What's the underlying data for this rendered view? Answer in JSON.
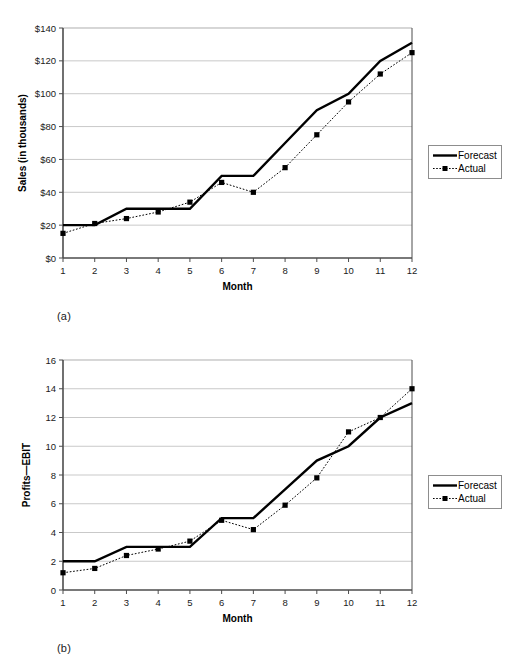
{
  "figures": [
    {
      "id": "a",
      "panel_label": "(a)",
      "legend": [
        {
          "name": "Forecast",
          "style": "solid-line"
        },
        {
          "name": "Actual",
          "style": "dotted-line-square-marker"
        }
      ]
    },
    {
      "id": "b",
      "panel_label": "(b)",
      "legend": [
        {
          "name": "Forecast",
          "style": "solid-line"
        },
        {
          "name": "Actual",
          "style": "dotted-line-square-marker"
        }
      ]
    }
  ],
  "chart_data": [
    {
      "type": "line",
      "title": "",
      "xlabel": "Month",
      "ylabel": "Sales (in thousands)",
      "x": [
        1,
        2,
        3,
        4,
        5,
        6,
        7,
        8,
        9,
        10,
        11,
        12
      ],
      "categories": [
        "1",
        "2",
        "3",
        "4",
        "5",
        "6",
        "7",
        "8",
        "9",
        "10",
        "11",
        "12"
      ],
      "ylim": [
        0,
        140
      ],
      "ytick_step": 20,
      "ytick_labels": [
        "$0",
        "$20",
        "$40",
        "$60",
        "$80",
        "$100",
        "$120",
        "$140"
      ],
      "ytick_values": [
        0,
        20,
        40,
        60,
        80,
        100,
        120,
        140
      ],
      "grid": true,
      "legend_position": "right",
      "series": [
        {
          "name": "Forecast",
          "style": "solid",
          "markers": false,
          "color": "#000000",
          "values": [
            20,
            20,
            30,
            30,
            30,
            50,
            50,
            70,
            90,
            100,
            120,
            131
          ]
        },
        {
          "name": "Actual",
          "style": "dotted",
          "markers": true,
          "color": "#000000",
          "values": [
            15,
            21,
            24,
            28,
            34,
            46,
            40,
            55,
            75,
            95,
            112,
            125
          ]
        }
      ]
    },
    {
      "type": "line",
      "title": "",
      "xlabel": "Month",
      "ylabel": "Profits—EBIT",
      "x": [
        1,
        2,
        3,
        4,
        5,
        6,
        7,
        8,
        9,
        10,
        11,
        12
      ],
      "categories": [
        "1",
        "2",
        "3",
        "4",
        "5",
        "6",
        "7",
        "8",
        "9",
        "10",
        "11",
        "12"
      ],
      "ylim": [
        0,
        16
      ],
      "ytick_step": 2,
      "ytick_labels": [
        "0",
        "2",
        "4",
        "6",
        "8",
        "10",
        "12",
        "14",
        "16"
      ],
      "ytick_values": [
        0,
        2,
        4,
        6,
        8,
        10,
        12,
        14,
        16
      ],
      "grid": true,
      "legend_position": "right",
      "series": [
        {
          "name": "Forecast",
          "style": "solid",
          "markers": false,
          "color": "#000000",
          "values": [
            2,
            2,
            3,
            3,
            3,
            5,
            5,
            7,
            9,
            10,
            12,
            13
          ]
        },
        {
          "name": "Actual",
          "style": "dotted",
          "markers": true,
          "color": "#000000",
          "values": [
            1.2,
            1.5,
            2.4,
            2.85,
            3.4,
            4.85,
            4.2,
            5.9,
            7.8,
            11,
            12,
            14
          ]
        }
      ]
    }
  ],
  "colors": {
    "line": "#000000",
    "grid": "#c9c9c9",
    "axis": "#4d4d4d",
    "background": "#ffffff",
    "legend_border": "#8d8d8d"
  }
}
